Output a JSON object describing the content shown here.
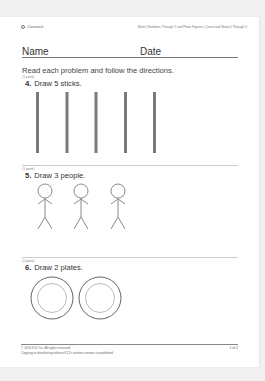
{
  "header": {
    "brand": "Classwork",
    "breadcrumb": "Math | Numbers Through 5 and Plane Figures | Count and Show 4 Through 5"
  },
  "form": {
    "name_label": "Name",
    "date_label": "Date"
  },
  "instructions": "Read each problem and follow the directions.",
  "problems": [
    {
      "points": "(1 point)",
      "number": "4.",
      "text": "Draw 5 sticks.",
      "drawing": "sticks",
      "count": 5
    },
    {
      "points": "(1 point)",
      "number": "5.",
      "text": "Draw 3 people.",
      "drawing": "stick-figures",
      "count": 3
    },
    {
      "points": "(1 point)",
      "number": "6.",
      "text": "Draw 2 plates.",
      "drawing": "plates",
      "count": 2
    }
  ],
  "footer": {
    "copyright": "© 2016 K12 Inc. All rights reserved.",
    "notice": "Copying or distributing without K12's written consent is prohibited.",
    "page": "1 of 2"
  },
  "colors": {
    "background": "#f1f1f1",
    "page": "#ffffff",
    "stroke": "#777777"
  }
}
